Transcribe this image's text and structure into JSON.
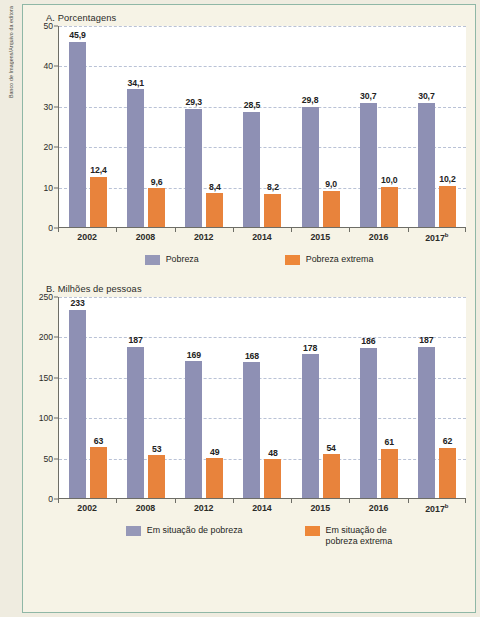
{
  "credit": {
    "text": "Banco de Imagens/Arquivo da editora"
  },
  "theme": {
    "page_bg": "#efece0",
    "frame_bg": "#f6f3e6",
    "frame_border": "#8fb7a6",
    "series_a_color": "#8e90b4",
    "series_b_color": "#e8833c",
    "grid_color": "#b9c2d6",
    "axis_color": "#6d6d66"
  },
  "chart_data": [
    {
      "type": "bar",
      "panel": "A",
      "title": "A. Porcentagens",
      "xlabel": "",
      "ylabel": "",
      "ylim": [
        0,
        50
      ],
      "yticks": [
        0,
        10,
        20,
        30,
        40,
        50
      ],
      "ytick_labels": [
        "0",
        "10",
        "20",
        "30",
        "40",
        "50"
      ],
      "grid": true,
      "legend_position": "bottom",
      "categories": [
        "2002",
        "2008",
        "2012",
        "2014",
        "2015",
        "2016",
        "2017"
      ],
      "category_labels": [
        "2002",
        "2008",
        "2012",
        "2014",
        "2015",
        "2016",
        "2017"
      ],
      "category_superscripts": [
        "",
        "",
        "",
        "",
        "",
        "",
        "b"
      ],
      "series": [
        {
          "name": "Pobreza",
          "color": "#8e90b4",
          "values": [
            45.9,
            34.1,
            29.3,
            28.5,
            29.8,
            30.7,
            30.7
          ],
          "labels": [
            "45,9",
            "34,1",
            "29,3",
            "28,5",
            "29,8",
            "30,7",
            "30,7"
          ]
        },
        {
          "name": "Pobreza extrema",
          "color": "#e8833c",
          "values": [
            12.4,
            9.6,
            8.4,
            8.2,
            9.0,
            10.0,
            10.2
          ],
          "labels": [
            "12,4",
            "9,6",
            "8,4",
            "8,2",
            "9,0",
            "10,0",
            "10,2"
          ]
        }
      ]
    },
    {
      "type": "bar",
      "panel": "B",
      "title": "B. Milhões de pessoas",
      "xlabel": "",
      "ylabel": "",
      "ylim": [
        0,
        250
      ],
      "yticks": [
        0,
        50,
        100,
        150,
        200,
        250
      ],
      "ytick_labels": [
        "0",
        "50",
        "100",
        "150",
        "200",
        "250"
      ],
      "grid": true,
      "legend_position": "bottom",
      "categories": [
        "2002",
        "2008",
        "2012",
        "2014",
        "2015",
        "2016",
        "2017"
      ],
      "category_labels": [
        "2002",
        "2008",
        "2012",
        "2014",
        "2015",
        "2016",
        "2017"
      ],
      "category_superscripts": [
        "",
        "",
        "",
        "",
        "",
        "",
        "b"
      ],
      "series": [
        {
          "name": "Em situação de pobreza",
          "color": "#8e90b4",
          "values": [
            233,
            187,
            169,
            168,
            178,
            186,
            187
          ],
          "labels": [
            "233",
            "187",
            "169",
            "168",
            "178",
            "186",
            "187"
          ]
        },
        {
          "name": "Em situação de pobreza extrema",
          "color": "#e8833c",
          "values": [
            63,
            53,
            49,
            48,
            54,
            61,
            62
          ],
          "labels": [
            "63",
            "53",
            "49",
            "48",
            "54",
            "61",
            "62"
          ]
        }
      ]
    }
  ],
  "legends": {
    "a": [
      {
        "label": "Pobreza",
        "color": "#9698b8"
      },
      {
        "label": "Pobreza extrema",
        "color": "#ed8739"
      }
    ],
    "b": [
      {
        "label": "Em situação de pobreza",
        "color": "#9698b8"
      },
      {
        "label_line1": "Em situação de",
        "label_line2": "pobreza extrema",
        "color": "#ed8739"
      }
    ]
  }
}
